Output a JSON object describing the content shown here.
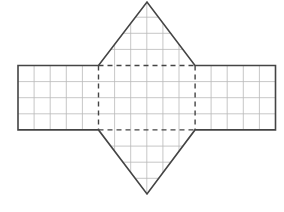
{
  "figure": {
    "grid": {
      "cell_px": 16.1,
      "color": "#b9b9b9",
      "line_width": 0.8
    },
    "outline": {
      "color": "#444444",
      "line_width": 1.6
    },
    "fold_lines": {
      "style": "dashed",
      "color": "#444444",
      "dash": "5,4"
    },
    "shapes": {
      "left_rectangle": {
        "x": 18,
        "y": 65.5,
        "cols": 5,
        "rows": 4
      },
      "center_rectangle": {
        "x": 98.5,
        "y": 65.5,
        "cols": 6,
        "rows": 4
      },
      "right_rectangle": {
        "x": 195,
        "y": 65.5,
        "cols": 5,
        "rows": 4
      },
      "top_triangle": {
        "apex": [
          147,
          2
        ],
        "base_left": [
          98.5,
          65.5
        ],
        "base_right": [
          195,
          65.5
        ]
      },
      "bottom_triangle": {
        "apex": [
          147,
          194
        ],
        "base_left": [
          98.5,
          130
        ],
        "base_right": [
          195,
          130
        ]
      }
    }
  }
}
